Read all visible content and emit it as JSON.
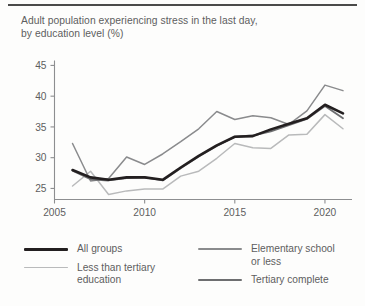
{
  "title": {
    "line1": "Adult population experiencing stress in the last day,",
    "line2": "by education level (%)"
  },
  "colors": {
    "all_groups": "#231f20",
    "less_than_tertiary": "#b9babb",
    "elementary_or_less": "#8a8b8d",
    "tertiary_complete": "#6d6e70",
    "axis": "#8d8e90",
    "text": "#5d5e60",
    "rule": "#4a4a4a",
    "background": "#fdfdfc"
  },
  "legend": {
    "left": [
      {
        "label": "All groups",
        "series": "all_groups",
        "color": "#231f20",
        "width": 2.6
      },
      {
        "label": "Less than tertiary\neducation",
        "series": "less_than_tertiary",
        "color": "#b9babb",
        "width": 1.5
      }
    ],
    "right": [
      {
        "label": "Elementary school\nor less",
        "series": "elementary_or_less",
        "color": "#8a8b8d",
        "width": 1.5
      },
      {
        "label": "Tertiary complete",
        "series": "tertiary_complete",
        "color": "#6d6e70",
        "width": 1.9
      }
    ]
  },
  "chart_data": {
    "type": "line",
    "title": "Adult population experiencing stress in the last day, by education level (%)",
    "xlabel": "",
    "ylabel": "",
    "xlim": [
      2005,
      2021.5
    ],
    "ylim": [
      23.2,
      45.8
    ],
    "xticks": [
      2005,
      2010,
      2015,
      2020
    ],
    "yticks": [
      25,
      30,
      35,
      40,
      45
    ],
    "grid": false,
    "legend_position": "bottom",
    "x": [
      2006,
      2007,
      2008,
      2009,
      2010,
      2011,
      2012,
      2013,
      2014,
      2015,
      2016,
      2017,
      2018,
      2019,
      2020,
      2021
    ],
    "series": [
      {
        "name": "All groups",
        "key": "all_groups",
        "color": "#231f20",
        "width": 2.6,
        "values": [
          28.0,
          26.8,
          26.4,
          26.8,
          26.8,
          26.4,
          28.4,
          30.3,
          32.0,
          33.4,
          33.5,
          34.6,
          35.5,
          36.4,
          38.6,
          37.2
        ]
      },
      {
        "name": "Less than tertiary education",
        "key": "less_than_tertiary",
        "color": "#b9babb",
        "width": 1.5,
        "values": [
          25.4,
          27.8,
          24.0,
          24.6,
          24.9,
          24.9,
          27.0,
          27.8,
          29.9,
          32.3,
          31.6,
          31.5,
          33.7,
          33.8,
          37.0,
          34.7
        ]
      },
      {
        "name": "Elementary school or less",
        "key": "elementary_or_less",
        "color": "#8a8b8d",
        "width": 1.5,
        "values": [
          32.3,
          26.2,
          26.6,
          30.1,
          28.9,
          30.6,
          32.6,
          34.7,
          37.5,
          36.2,
          36.8,
          36.5,
          35.4,
          37.6,
          41.8,
          40.9
        ]
      },
      {
        "name": "Tertiary complete",
        "key": "tertiary_complete",
        "color": "#6d6e70",
        "width": 1.9,
        "values": [
          27.9,
          26.5,
          26.3,
          26.7,
          26.8,
          26.3,
          28.3,
          30.2,
          31.9,
          33.4,
          33.6,
          34.3,
          35.3,
          36.3,
          38.4,
          36.4
        ]
      }
    ]
  }
}
